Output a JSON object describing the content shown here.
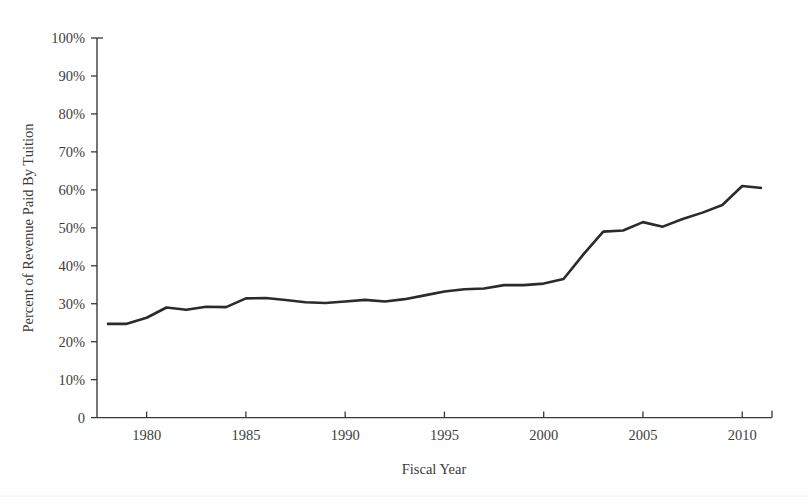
{
  "chart_data": {
    "type": "line",
    "title": "",
    "xlabel": "Fiscal Year",
    "ylabel": "Percent of Revenue Paid By Tuition",
    "xlim": [
      1977.5,
      2011.5
    ],
    "ylim": [
      0,
      100
    ],
    "grid": false,
    "legend": "none",
    "line_color": "#2b2b2b",
    "xticks": [
      1980,
      1985,
      1990,
      1995,
      2000,
      2005,
      2010
    ],
    "xtick_labels": [
      "1980",
      "1985",
      "1990",
      "1995",
      "2000",
      "2005",
      "2010"
    ],
    "yticks": [
      0,
      10,
      20,
      30,
      40,
      50,
      60,
      70,
      80,
      90,
      100
    ],
    "ytick_labels": [
      "0",
      "10%",
      "20%",
      "30%",
      "40%",
      "50%",
      "60%",
      "70%",
      "80%",
      "90%",
      "100%"
    ],
    "series": [
      {
        "name": "Percent of Revenue Paid By Tuition",
        "x": [
          1978,
          1979,
          1980,
          1981,
          1982,
          1983,
          1984,
          1985,
          1986,
          1987,
          1988,
          1989,
          1990,
          1991,
          1992,
          1993,
          1994,
          1995,
          1996,
          1997,
          1998,
          1999,
          2000,
          2001,
          2002,
          2003,
          2004,
          2005,
          2006,
          2007,
          2008,
          2009,
          2010,
          2011
        ],
        "values": [
          24.7,
          24.7,
          26.3,
          29.0,
          28.4,
          29.2,
          29.1,
          31.4,
          31.5,
          31.0,
          30.4,
          30.2,
          30.6,
          31.0,
          30.6,
          31.2,
          32.2,
          33.2,
          33.8,
          34.0,
          34.9,
          34.9,
          35.3,
          36.5,
          43.0,
          49.0,
          49.3,
          51.5,
          50.3,
          52.3,
          54.0,
          56.0,
          61.0,
          60.5
        ]
      }
    ]
  },
  "axis": {
    "x_title": "Fiscal Year",
    "y_title": "Percent of Revenue Paid By Tuition"
  }
}
